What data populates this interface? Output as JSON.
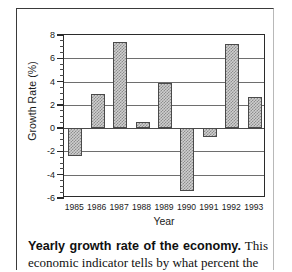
{
  "chart_data": {
    "type": "bar",
    "title": "",
    "xlabel": "Year",
    "ylabel": "Growth Rate (%)",
    "categories": [
      "1985",
      "1986",
      "1987",
      "1988",
      "1989",
      "1990",
      "1991",
      "1992",
      "1993"
    ],
    "values": [
      -2.4,
      2.9,
      7.4,
      0.55,
      3.9,
      -5.4,
      -0.8,
      7.2,
      2.65
    ],
    "ylim": [
      -6,
      8
    ],
    "ytick_labels": [
      "8",
      "6",
      "4",
      "2",
      "0",
      "-2",
      "-4",
      "-6"
    ],
    "ytick_values": [
      8,
      6,
      4,
      2,
      0,
      -2,
      -4,
      -6
    ],
    "yminor_step": 0.5,
    "gridlines": [
      6,
      4,
      2,
      0,
      -2,
      -4
    ],
    "grid": true,
    "legend": "none",
    "bar_fill": "#cfcfcf",
    "bar_hatch_color": "#8e8e8e",
    "bar_edge": "#4a4a4a",
    "axis_color": "#2b2b2b"
  },
  "caption": {
    "lead": "Yearly growth rate of the economy.",
    "body": " This economic indicator tells by what percent the"
  }
}
